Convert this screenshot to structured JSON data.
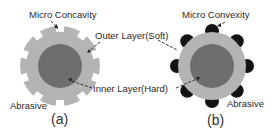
{
  "figure": {
    "panel_a": {
      "caption": "(a)",
      "top_label": "Micro Concavity",
      "abrasive_label": "Abrasive"
    },
    "panel_b": {
      "caption": "(b)",
      "top_label": "Micro Convexity",
      "abrasive_label": "Abrasive"
    },
    "shared_labels": {
      "outer_layer": "Outer Layer(Soft)",
      "inner_layer": "Inner Layer(Hard)"
    },
    "colors": {
      "outer_layer": "#b4b4b4",
      "inner_layer": "#6e6e6e",
      "abrasive_bump": "#141414",
      "leader_line": "#222222",
      "background": "#ffffff"
    }
  }
}
